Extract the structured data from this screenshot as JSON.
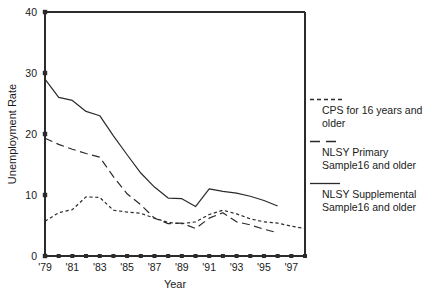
{
  "chart_data": {
    "type": "line",
    "title": "",
    "xlabel": "Year",
    "ylabel": "Unemployment Rate",
    "xlim": [
      1979,
      1998
    ],
    "ylim": [
      0,
      40
    ],
    "yticks": [
      0,
      10,
      20,
      30,
      40
    ],
    "ytick_labels": [
      "0",
      "10",
      "20",
      "30",
      "40"
    ],
    "xticks": [
      1979,
      1980,
      1981,
      1982,
      1983,
      1984,
      1985,
      1986,
      1987,
      1988,
      1989,
      1990,
      1991,
      1992,
      1993,
      1994,
      1995,
      1996,
      1997,
      1998
    ],
    "xtick_labels": [
      "'79",
      "",
      "'81",
      "",
      "'83",
      "",
      "'85",
      "",
      "'87",
      "",
      "'89",
      "",
      "'91",
      "",
      "'93",
      "",
      "'95",
      "",
      "'97",
      ""
    ],
    "grid": false,
    "legend_position": "right",
    "series": [
      {
        "name": "CPS for 16 years and older",
        "style": "dotted",
        "color": "#2b2b2b",
        "x": [
          1979,
          1980,
          1981,
          1982,
          1983,
          1984,
          1985,
          1986,
          1987,
          1988,
          1989,
          1990,
          1991,
          1992,
          1993,
          1994,
          1995,
          1996,
          1997,
          1998
        ],
        "values": [
          5.7,
          7.1,
          7.6,
          9.7,
          9.6,
          7.5,
          7.2,
          7.0,
          6.2,
          5.5,
          5.3,
          5.6,
          6.8,
          7.5,
          6.9,
          6.1,
          5.6,
          5.4,
          4.9,
          4.5
        ]
      },
      {
        "name": "NLSY Primary Sample16 and older",
        "style": "dashed",
        "color": "#2b2b2b",
        "x": [
          1979,
          1980,
          1981,
          1982,
          1983,
          1984,
          1985,
          1986,
          1987,
          1988,
          1989,
          1990,
          1991,
          1992,
          1993,
          1994,
          1995,
          1996
        ],
        "values": [
          19.3,
          18.3,
          17.5,
          16.8,
          16.2,
          13.0,
          10.2,
          8.4,
          6.2,
          5.3,
          5.4,
          4.5,
          6.2,
          7.1,
          5.6,
          5.1,
          4.4,
          3.8
        ]
      },
      {
        "name": "NLSY Supplemental Sample16 and older",
        "style": "solid",
        "color": "#2b2b2b",
        "x": [
          1979,
          1980,
          1981,
          1982,
          1983,
          1984,
          1985,
          1986,
          1987,
          1988,
          1989,
          1990,
          1991,
          1992,
          1993,
          1994,
          1995,
          1996
        ],
        "values": [
          29.0,
          26.0,
          25.5,
          23.7,
          23.0,
          19.7,
          16.6,
          13.6,
          11.3,
          9.5,
          9.4,
          8.1,
          11.0,
          10.6,
          10.3,
          9.8,
          9.1,
          8.2
        ]
      }
    ]
  },
  "axes": {
    "ylabel": "Unemployment Rate",
    "xlabel": "Year"
  },
  "legend": {
    "entries": [
      {
        "label": "CPS for 16 years and\nolder",
        "style": "dotted"
      },
      {
        "label": "NLSY Primary\nSample16 and older",
        "style": "dashed"
      },
      {
        "label": "NLSY Supplemental\nSample16 and older",
        "style": "solid"
      }
    ]
  }
}
